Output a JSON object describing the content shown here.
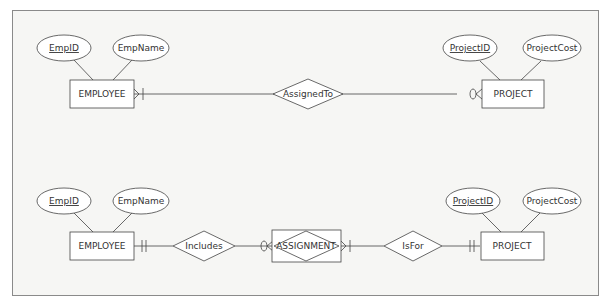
{
  "diagram_top": {
    "entity_left": {
      "label": "EMPLOYEE",
      "attributes": [
        {
          "label": "EmpID",
          "key": true
        },
        {
          "label": "EmpName",
          "key": false
        }
      ]
    },
    "relationship": {
      "label": "AssignedTo"
    },
    "entity_right": {
      "label": "PROJECT",
      "attributes": [
        {
          "label": "ProjectID",
          "key": true
        },
        {
          "label": "ProjectCost",
          "key": false
        }
      ]
    },
    "cardinality": {
      "left": "one-or-many",
      "right": "zero-or-many"
    }
  },
  "diagram_bottom": {
    "entity_left": {
      "label": "EMPLOYEE",
      "attributes": [
        {
          "label": "EmpID",
          "key": true
        },
        {
          "label": "EmpName",
          "key": false
        }
      ]
    },
    "relationship_left": {
      "label": "Includes"
    },
    "associative_entity": {
      "label": "ASSIGNMENT"
    },
    "relationship_right": {
      "label": "IsFor"
    },
    "entity_right": {
      "label": "PROJECT",
      "attributes": [
        {
          "label": "ProjectID",
          "key": true
        },
        {
          "label": "ProjectCost",
          "key": false
        }
      ]
    },
    "cardinality": {
      "employee_side": "one-and-only-one",
      "assignment_left": "zero-or-many",
      "assignment_right": "one-or-many",
      "project_side": "one-and-only-one"
    }
  }
}
